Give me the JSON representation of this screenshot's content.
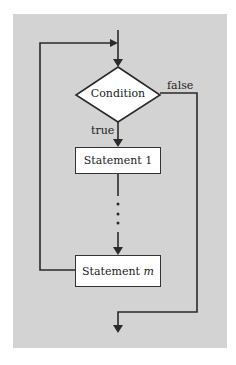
{
  "diagram": {
    "type": "flowchart-while-loop",
    "background_color": "#d3d3d3",
    "decision": {
      "label": "Condition"
    },
    "branches": {
      "true_label": "true",
      "false_label": "false"
    },
    "statements": [
      {
        "label": "Statement 1"
      },
      {
        "label_prefix": "Statement ",
        "label_var": "m"
      }
    ],
    "ellipsis": "⋮"
  }
}
